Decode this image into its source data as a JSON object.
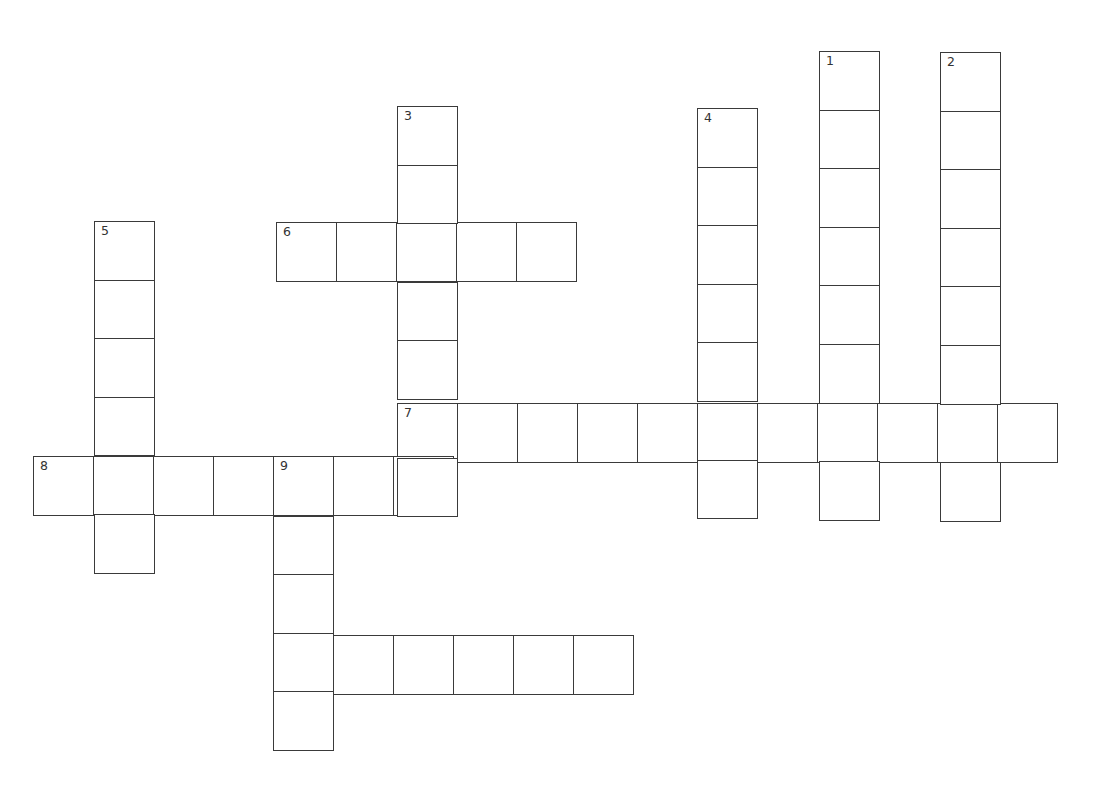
{
  "puzzle": {
    "type": "crossword",
    "cell_width": 60,
    "cell_height": 58.6,
    "line_color": "#3a3a3a",
    "background": "#ffffff",
    "clues": {
      "down": [
        {
          "number": "1",
          "length": 8,
          "x": 819,
          "y": 51
        },
        {
          "number": "2",
          "length": 8,
          "x": 940,
          "y": 52
        },
        {
          "number": "3",
          "length": 7,
          "x": 397,
          "y": 106
        },
        {
          "number": "4",
          "length": 7,
          "x": 697,
          "y": 108
        },
        {
          "number": "5",
          "length": 6,
          "x": 94,
          "y": 221
        },
        {
          "number": "9",
          "length": 5,
          "x": 273,
          "y": 457
        }
      ],
      "across": [
        {
          "number": "6",
          "length": 5,
          "x": 276,
          "y": 222
        },
        {
          "number": "7",
          "length": 11,
          "x": 397,
          "y": 403
        },
        {
          "number": "8",
          "length": 7,
          "x": 33,
          "y": 456
        },
        {
          "number": "10",
          "length": 6,
          "x": 273,
          "y": 635
        }
      ]
    }
  }
}
